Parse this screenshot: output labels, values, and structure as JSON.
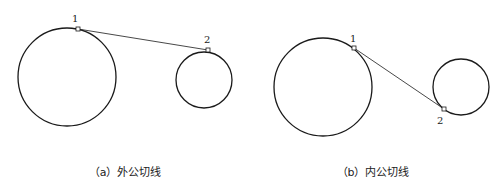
{
  "colors": {
    "stroke": "#1a1a1a",
    "line": "#333333",
    "background": "#ffffff"
  },
  "panels": [
    {
      "id": "a",
      "caption": "（a）外公切线",
      "big_circle": {
        "cx": 67,
        "cy": 77,
        "r": 49
      },
      "small_circle": {
        "cx": 204,
        "cy": 80,
        "r": 28
      },
      "tangent": {
        "x1": 78,
        "y1": 29,
        "x2": 208,
        "y2": 50
      },
      "points": [
        {
          "label": "1",
          "x": 78,
          "y": 29,
          "lx": 72,
          "ly": 22
        },
        {
          "label": "2",
          "x": 208,
          "y": 50,
          "lx": 204,
          "ly": 43
        }
      ],
      "caption_x": 125
    },
    {
      "id": "b",
      "caption": "（b）内公切线",
      "big_circle": {
        "cx": 323,
        "cy": 87,
        "r": 49
      },
      "small_circle": {
        "cx": 461,
        "cy": 87,
        "r": 28
      },
      "tangent": {
        "x1": 354,
        "y1": 48,
        "x2": 444,
        "y2": 109
      },
      "points": [
        {
          "label": "1",
          "x": 354,
          "y": 48,
          "lx": 350,
          "ly": 42
        },
        {
          "label": "2",
          "x": 444,
          "y": 109,
          "lx": 437,
          "ly": 124
        }
      ],
      "caption_x": 373
    }
  ]
}
